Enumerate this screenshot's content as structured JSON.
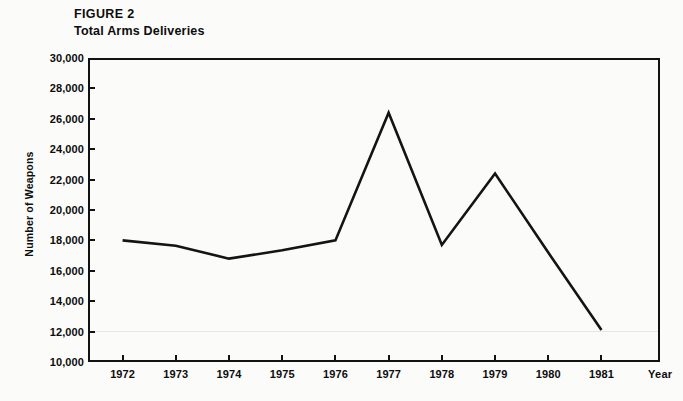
{
  "figure": {
    "number_label": "FIGURE 2",
    "subtitle": "Total Arms Deliveries"
  },
  "chart_data": {
    "type": "line",
    "title": "Total Arms Deliveries",
    "subtitle": "FIGURE 2",
    "xlabel": "Year",
    "ylabel": "Number of Weapons",
    "categories": [
      "1972",
      "1973",
      "1974",
      "1975",
      "1976",
      "1977",
      "1978",
      "1979",
      "1980",
      "1981"
    ],
    "x": [
      1972,
      1973,
      1974,
      1975,
      1976,
      1977,
      1978,
      1979,
      1980,
      1981
    ],
    "values": [
      18000,
      17650,
      16800,
      17350,
      18000,
      26400,
      17700,
      22400,
      17200,
      12100
    ],
    "series": [
      {
        "name": "Total Arms Deliveries",
        "values": [
          18000,
          17650,
          16800,
          17350,
          18000,
          26400,
          17700,
          22400,
          17200,
          12100
        ]
      }
    ],
    "ylim": [
      10000,
      30000
    ],
    "ytick_values": [
      10000,
      12000,
      14000,
      16000,
      18000,
      20000,
      22000,
      24000,
      26000,
      28000,
      30000
    ],
    "ytick_labels": [
      "10,000",
      "12,000",
      "14,000",
      "16,000",
      "18,000",
      "20,000",
      "22,000",
      "24,000",
      "26,000",
      "28,000",
      "30,000"
    ],
    "xtick_labels": [
      "1972",
      "1973",
      "1974",
      "1975",
      "1976",
      "1977",
      "1978",
      "1979",
      "1980",
      "1981"
    ],
    "xlim": [
      1971.35,
      1982.1
    ],
    "grid": false,
    "legend": null,
    "line_color": "#141414",
    "background_color": "#fbfbfa",
    "axis_color": "#121212"
  },
  "axes": {
    "y_title": "Number of Weapons",
    "x_title": "Year"
  }
}
